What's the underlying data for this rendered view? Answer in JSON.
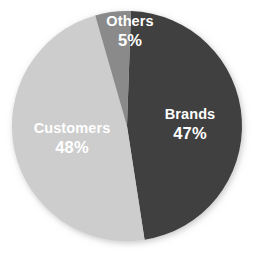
{
  "chart_data": {
    "type": "pie",
    "title": "",
    "subtitle": "",
    "xlabel": "",
    "ylabel": "",
    "legend_position": "none",
    "grid": false,
    "labels_inside": true,
    "value_unit": "%",
    "categories": [
      "Brands",
      "Customers",
      "Others"
    ],
    "values": [
      47,
      48,
      5
    ],
    "slices": [
      {
        "name": "Brands",
        "value": 47,
        "value_label": "47%",
        "color": "#3f3f3f",
        "start_angle_deg": 2,
        "end_angle_deg": 171.2
      },
      {
        "name": "Customers",
        "value": 48,
        "value_label": "48%",
        "color": "#cdcdcd",
        "start_angle_deg": 171.2,
        "end_angle_deg": 344.0
      },
      {
        "name": "Others",
        "value": 5,
        "value_label": "5%",
        "color": "#8a8a8a",
        "start_angle_deg": 344.0,
        "end_angle_deg": 362
      }
    ],
    "total": 100,
    "background_color": "#ffffff",
    "label_text_color": "#ffffff"
  },
  "figure": {
    "center_x": 127,
    "center_y": 126,
    "radius": 115
  }
}
